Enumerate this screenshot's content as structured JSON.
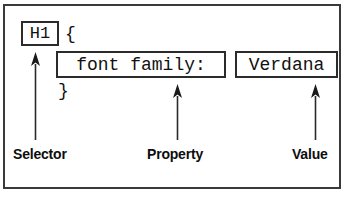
{
  "figure": {
    "frame_color": "#3a3a3a",
    "box_border_color": "#2b2b2b",
    "text_color": "#111111",
    "background": "#ffffff"
  },
  "code": {
    "selector": "H1",
    "brace_open": "{",
    "property": "font family:",
    "value": "Verdana",
    "brace_close": "}"
  },
  "annotations": [
    {
      "label": "Selector",
      "target": "selector",
      "arrow": "up-arrow-icon"
    },
    {
      "label": "Property",
      "target": "property",
      "arrow": "up-arrow-icon"
    },
    {
      "label": "Value",
      "target": "value",
      "arrow": "up-arrow-icon"
    }
  ]
}
